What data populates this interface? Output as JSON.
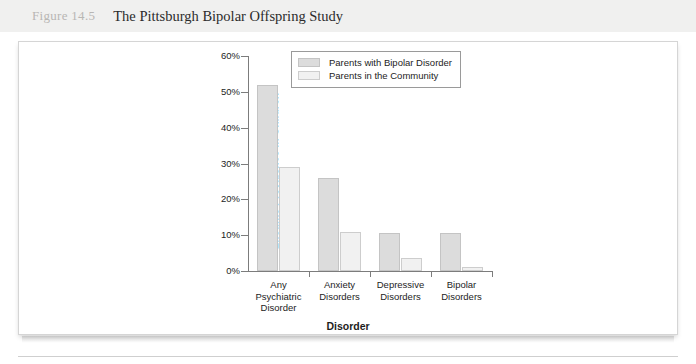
{
  "header": {
    "figure_number": "Figure 14.5",
    "figure_title": "The Pittsburgh Bipolar Offspring Study"
  },
  "chart_data": {
    "type": "bar",
    "title": "The Pittsburgh Bipolar Offspring Study",
    "xlabel": "Disorder",
    "ylabel": "Lifetime Prevalence in Children",
    "categories": [
      "Any Psychiatric Disorder",
      "Anxiety Disorders",
      "Depressive Disorders",
      "Bipolar Disorders"
    ],
    "category_lines": [
      [
        "Any",
        "Psychiatric",
        "Disorder"
      ],
      [
        "Anxiety",
        "Disorders"
      ],
      [
        "Depressive",
        "Disorders"
      ],
      [
        "Bipolar",
        "Disorders"
      ]
    ],
    "series": [
      {
        "name": "Parents with Bipolar Disorder",
        "color": "#dcdcdc",
        "values": [
          52,
          26,
          10.5,
          10.5
        ]
      },
      {
        "name": "Parents in the Community",
        "color": "#f1f1f1",
        "values": [
          29,
          11,
          3.5,
          1
        ]
      }
    ],
    "ylim": [
      0,
      60
    ],
    "yticks": [
      0,
      10,
      20,
      30,
      40,
      50,
      60
    ],
    "ytick_labels": [
      "0%",
      "10%",
      "20%",
      "30%",
      "40%",
      "50%",
      "60%"
    ],
    "grid": false,
    "legend_position": "top-center"
  }
}
